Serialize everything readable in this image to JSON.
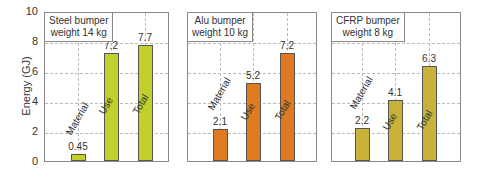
{
  "chart_data": {
    "type": "bar",
    "ylabel": "Energy (GJ)",
    "ylim": [
      0,
      10
    ],
    "yticks": [
      "0",
      "2",
      "4",
      "6",
      "8",
      "10"
    ],
    "grid": true,
    "categories": [
      "Material",
      "Use",
      "Total"
    ],
    "panels": [
      {
        "title_line1": "Steel bumper",
        "title_line2": "weight 14 kg",
        "color": "#c3cf2a",
        "values": [
          0.45,
          7.2,
          7.7
        ],
        "labels": [
          "0.45",
          "7.2",
          "7.7"
        ]
      },
      {
        "title_line1": "Alu bumper",
        "title_line2": "weight 10 kg",
        "color": "#e07a22",
        "values": [
          2.1,
          5.2,
          7.2
        ],
        "labels": [
          "2.1",
          "5.2",
          "7.2"
        ]
      },
      {
        "title_line1": "CFRP bumper",
        "title_line2": "weight 8 kg",
        "color": "#c9b23a",
        "values": [
          2.2,
          4.1,
          6.3
        ],
        "labels": [
          "2.2",
          "4.1",
          "6.3"
        ]
      }
    ]
  }
}
